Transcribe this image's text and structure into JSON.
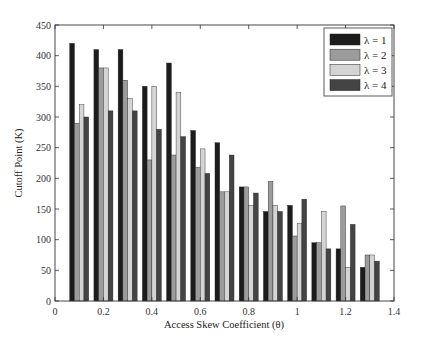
{
  "chart_data": {
    "type": "bar",
    "title": "",
    "xlabel": "Access Skew Coefficient (θ)",
    "ylabel": "Cutoff Point (K)",
    "xlim": [
      0,
      1.4
    ],
    "ylim": [
      0,
      450
    ],
    "xticks": [
      0,
      0.2,
      0.4,
      0.6,
      0.8,
      1,
      1.2,
      1.4
    ],
    "xtick_labels": [
      "0",
      "0.2",
      "0.4",
      "0.6",
      "0.8",
      "1",
      "1.2",
      "1.4"
    ],
    "yticks": [
      0,
      50,
      100,
      150,
      200,
      250,
      300,
      350,
      400,
      450
    ],
    "ytick_labels": [
      "0",
      "50",
      "100",
      "150",
      "200",
      "250",
      "300",
      "350",
      "400",
      "450"
    ],
    "grid": false,
    "legend_position": "upper right",
    "categories": [
      0.1,
      0.2,
      0.3,
      0.4,
      0.5,
      0.6,
      0.7,
      0.8,
      0.9,
      1.0,
      1.1,
      1.2,
      1.3
    ],
    "series": [
      {
        "name": "λ = 1",
        "color": "#1c1c1c",
        "values": [
          420,
          410,
          410,
          350,
          388,
          278,
          258,
          186,
          146,
          156,
          95,
          85,
          55
        ]
      },
      {
        "name": "λ = 2",
        "color": "#9c9c9c",
        "values": [
          290,
          380,
          360,
          230,
          238,
          218,
          178,
          186,
          195,
          106,
          95,
          155,
          75
        ]
      },
      {
        "name": "λ = 3",
        "color": "#d4d4d4",
        "values": [
          320,
          380,
          330,
          350,
          340,
          248,
          178,
          156,
          156,
          126,
          146,
          55,
          75
        ]
      },
      {
        "name": "λ = 4",
        "color": "#444444",
        "values": [
          300,
          310,
          310,
          280,
          268,
          208,
          238,
          176,
          146,
          166,
          85,
          125,
          65
        ]
      }
    ]
  }
}
